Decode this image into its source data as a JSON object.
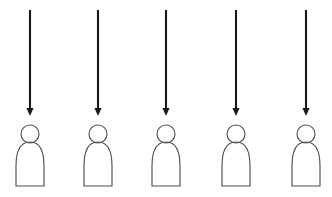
{
  "canvas": {
    "width": 332,
    "height": 197,
    "background_color": "#ffffff",
    "description": "Five identical downward-pointing arrows in a horizontal row, each ending just above a simple outlined person icon"
  },
  "style": {
    "arrow_color": "#1a1a1a",
    "arrow_shaft_width": 2.1,
    "person_outline_color": "#4d4d4d",
    "person_outline_width": 1.15,
    "person_fill": "#ffffff"
  },
  "geometry": {
    "arrow_top_y": 10,
    "arrow_shaft_bottom_y": 108,
    "arrow_tip_y": 116,
    "arrow_head_half_width": 3.6,
    "head_center_y": 134,
    "head_radius": 9,
    "body_top_y": 142,
    "body_bottom_y": 186,
    "body_half_width": 14,
    "body_straight_y": 166
  },
  "columns": [
    {
      "id": "column-1",
      "center_x": 30,
      "arrow": {
        "name": "down-arrow",
        "direction": "down"
      },
      "person": {
        "name": "person-figure",
        "parts": [
          "head",
          "body"
        ]
      }
    },
    {
      "id": "column-2",
      "center_x": 98,
      "arrow": {
        "name": "down-arrow",
        "direction": "down"
      },
      "person": {
        "name": "person-figure",
        "parts": [
          "head",
          "body"
        ]
      }
    },
    {
      "id": "column-3",
      "center_x": 166,
      "arrow": {
        "name": "down-arrow",
        "direction": "down"
      },
      "person": {
        "name": "person-figure",
        "parts": [
          "head",
          "body"
        ]
      }
    },
    {
      "id": "column-4",
      "center_x": 236,
      "arrow": {
        "name": "down-arrow",
        "direction": "down"
      },
      "person": {
        "name": "person-figure",
        "parts": [
          "head",
          "body"
        ]
      }
    },
    {
      "id": "column-5",
      "center_x": 306,
      "arrow": {
        "name": "down-arrow",
        "direction": "down"
      },
      "person": {
        "name": "person-figure",
        "parts": [
          "head",
          "body"
        ]
      }
    }
  ],
  "labels": {
    "text_items": []
  }
}
